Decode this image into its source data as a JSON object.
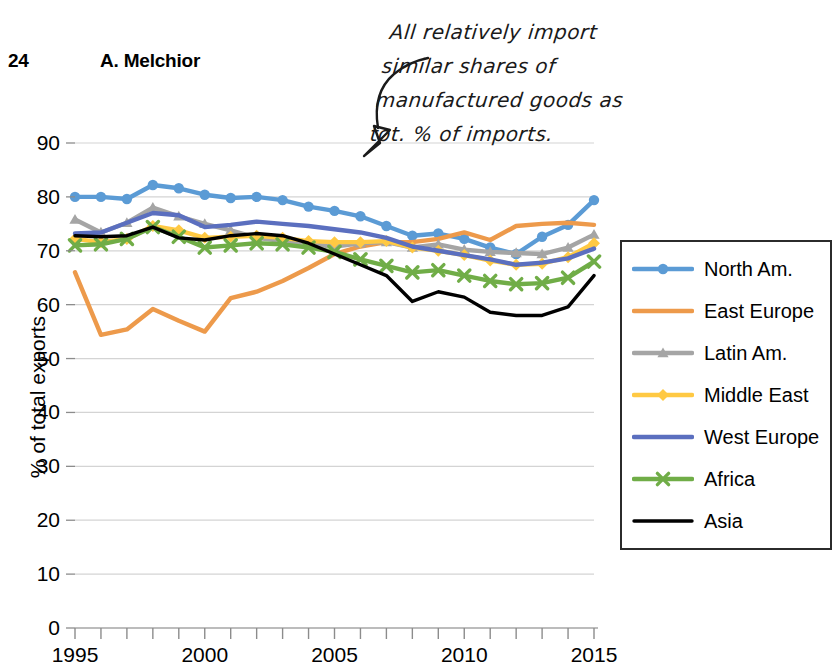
{
  "page": {
    "page_number": "24",
    "running_head": "A. Melchior"
  },
  "annotation": {
    "icon": "curved-arrow-down-left-icon",
    "lines": [
      "All relatively import",
      "similar shares of",
      "manufactured goods as",
      "tot. % of imports."
    ],
    "full_text": "All relatively import similar shares of manufactured goods as tot. % of imports."
  },
  "legend": {
    "position": "right",
    "entries": [
      {
        "label": "North Am.",
        "color": "#5B9BD5",
        "marker": "circle"
      },
      {
        "label": "East Europe",
        "color": "#ED9A4B",
        "marker": "none"
      },
      {
        "label": "Latin Am.",
        "color": "#A5A5A5",
        "marker": "triangle"
      },
      {
        "label": "Middle East",
        "color": "#FFC943",
        "marker": "diamond"
      },
      {
        "label": "West Europe",
        "color": "#5B6FBF",
        "marker": "none"
      },
      {
        "label": "Africa",
        "color": "#70AD47",
        "marker": "cross"
      },
      {
        "label": "Asia",
        "color": "#000000",
        "marker": "none"
      }
    ]
  },
  "chart_data": {
    "type": "line",
    "title": "",
    "xlabel": "",
    "ylabel": "% of total exports",
    "xlim": [
      1995,
      2015
    ],
    "ylim": [
      0,
      90
    ],
    "ytick_labels": [
      "0",
      "10",
      "20",
      "30",
      "40",
      "50",
      "60",
      "70",
      "80",
      "90"
    ],
    "yticks": [
      0,
      10,
      20,
      30,
      40,
      50,
      60,
      70,
      80,
      90
    ],
    "xtick_labels": [
      "1995",
      "2000",
      "2005",
      "2010",
      "2015"
    ],
    "xticks": [
      1995,
      2000,
      2005,
      2010,
      2015
    ],
    "minor_xtick_interval": 1,
    "grid": "horizontal",
    "legend_position": "right",
    "x": [
      1995,
      1996,
      1997,
      1998,
      1999,
      2000,
      2001,
      2002,
      2003,
      2004,
      2005,
      2006,
      2007,
      2008,
      2009,
      2010,
      2011,
      2012,
      2013,
      2014,
      2015
    ],
    "series": [
      {
        "name": "North Am.",
        "color": "#5B9BD5",
        "marker": "circle",
        "values": [
          80.0,
          80.0,
          79.6,
          82.2,
          81.6,
          80.4,
          79.8,
          80.0,
          79.4,
          78.2,
          77.4,
          76.4,
          74.6,
          72.8,
          73.2,
          72.2,
          70.6,
          69.4,
          72.6,
          74.8,
          79.4
        ]
      },
      {
        "name": "East Europe",
        "color": "#ED9A4B",
        "marker": "none",
        "values": [
          66.0,
          54.4,
          55.4,
          59.2,
          57.0,
          55.0,
          61.2,
          62.4,
          64.4,
          66.8,
          69.4,
          70.8,
          71.6,
          71.6,
          72.2,
          73.4,
          72.0,
          74.6,
          75.0,
          75.2,
          74.8
        ]
      },
      {
        "name": "Latin Am.",
        "color": "#A5A5A5",
        "marker": "triangle",
        "values": [
          75.8,
          73.4,
          75.2,
          78.0,
          76.4,
          75.0,
          73.8,
          72.4,
          71.8,
          71.2,
          70.8,
          71.4,
          71.6,
          70.6,
          71.2,
          70.2,
          69.8,
          69.6,
          69.4,
          70.6,
          73.0
        ]
      },
      {
        "name": "Middle East",
        "color": "#FFC943",
        "marker": "diamond",
        "values": [
          72.2,
          71.6,
          72.2,
          74.6,
          73.8,
          72.4,
          72.6,
          72.8,
          72.4,
          71.8,
          71.6,
          71.6,
          71.8,
          70.6,
          70.0,
          69.2,
          68.2,
          67.4,
          67.6,
          68.8,
          71.4
        ]
      },
      {
        "name": "West Europe",
        "color": "#5B6FBF",
        "marker": "none",
        "values": [
          73.2,
          73.4,
          75.2,
          77.0,
          76.6,
          74.4,
          74.8,
          75.4,
          75.0,
          74.6,
          74.0,
          73.4,
          72.4,
          70.8,
          70.0,
          69.2,
          68.4,
          67.4,
          67.8,
          68.6,
          70.4
        ]
      },
      {
        "name": "Africa",
        "color": "#70AD47",
        "marker": "cross",
        "values": [
          71.0,
          71.2,
          72.2,
          74.4,
          72.6,
          70.6,
          71.0,
          71.4,
          71.2,
          70.6,
          69.8,
          68.4,
          67.2,
          66.0,
          66.4,
          65.4,
          64.4,
          63.8,
          64.0,
          65.0,
          68.0
        ]
      },
      {
        "name": "Asia",
        "color": "#000000",
        "marker": "none",
        "values": [
          72.8,
          72.6,
          72.8,
          74.4,
          72.4,
          72.0,
          72.8,
          73.2,
          72.8,
          71.4,
          69.4,
          67.4,
          65.4,
          60.6,
          62.4,
          61.4,
          58.6,
          58.0,
          58.0,
          59.6,
          65.4
        ]
      }
    ]
  }
}
